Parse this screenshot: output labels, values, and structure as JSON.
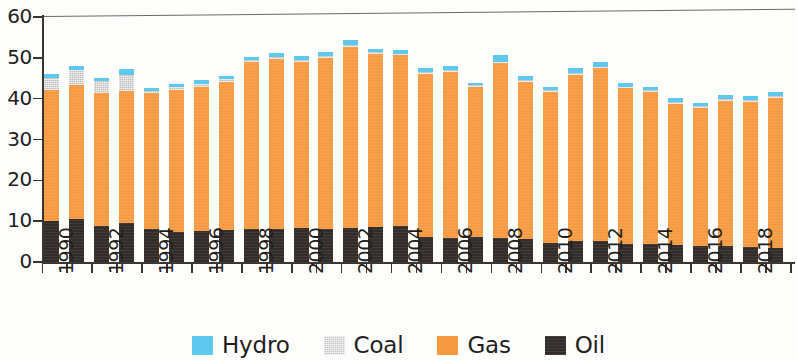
{
  "chart_data": {
    "type": "bar",
    "stacked": true,
    "title": "",
    "subtitle": "",
    "xlabel": "",
    "ylabel": "",
    "ylim": [
      0,
      60
    ],
    "ytick_labels": [
      "60",
      "50",
      "40",
      "30",
      "20",
      "10",
      "0"
    ],
    "ytick_values": [
      60,
      50,
      40,
      30,
      20,
      10,
      0
    ],
    "grid": false,
    "legend_position": "bottom",
    "categories": [
      "1990",
      "1991",
      "1992",
      "1993",
      "1994",
      "1995",
      "1996",
      "1997",
      "1998",
      "1999",
      "2000",
      "2001",
      "2002",
      "2003",
      "2004",
      "2005",
      "2006",
      "2007",
      "2008",
      "2009",
      "2010",
      "2011",
      "2012",
      "2013",
      "2014",
      "2015",
      "2016",
      "2017",
      "2018",
      "2019"
    ],
    "xtick_labels_shown": [
      "1990",
      "1992",
      "1994",
      "1996",
      "1998",
      "2000",
      "2002",
      "2004",
      "2006",
      "2008",
      "2010",
      "2012",
      "2014",
      "2016",
      "2018"
    ],
    "series": [
      {
        "name": "Oil",
        "color": "#332d2a",
        "values": [
          10.3,
          10.8,
          9.0,
          9.9,
          8.3,
          7.6,
          7.9,
          8.2,
          8.4,
          8.3,
          8.5,
          8.4,
          8.6,
          8.7,
          9.0,
          6.4,
          6.2,
          6.4,
          6.1,
          5.8,
          5.0,
          5.3,
          5.4,
          4.6,
          4.6,
          4.3,
          4.2,
          4.1,
          3.9,
          3.7
        ]
      },
      {
        "name": "Gas",
        "color": "#f79a41",
        "values": [
          32.0,
          32.8,
          32.7,
          32.2,
          33.3,
          34.8,
          35.1,
          36.1,
          40.8,
          41.6,
          40.8,
          41.9,
          44.3,
          42.4,
          41.9,
          40.0,
          40.7,
          36.6,
          42.8,
          38.6,
          36.9,
          40.8,
          42.3,
          38.2,
          37.3,
          34.7,
          33.8,
          35.7,
          35.5,
          36.8
        ]
      },
      {
        "name": "Coal",
        "color": "#c6c5c4",
        "values": [
          3.1,
          3.6,
          2.9,
          3.9,
          0.6,
          0.6,
          0.8,
          0.7,
          0.4,
          0.5,
          0.5,
          0.4,
          0.5,
          0.5,
          0.4,
          0.4,
          0.4,
          0.5,
          0.4,
          0.4,
          0.4,
          0.5,
          0.4,
          0.4,
          0.4,
          0.4,
          0.4,
          0.4,
          0.5,
          0.4
        ]
      },
      {
        "name": "Hydro",
        "color": "#5ec8ef",
        "values": [
          0.9,
          1.1,
          0.8,
          1.4,
          0.6,
          0.8,
          1.1,
          0.9,
          0.8,
          1.0,
          1.0,
          0.9,
          1.2,
          0.8,
          0.9,
          0.9,
          0.9,
          0.7,
          1.6,
          1.0,
          0.9,
          1.1,
          1.1,
          0.9,
          0.9,
          0.9,
          0.8,
          0.9,
          0.9,
          1.0
        ]
      }
    ],
    "totals": [
      46.3,
      48.3,
      45.4,
      47.4,
      42.8,
      43.8,
      44.9,
      45.9,
      50.4,
      51.4,
      50.8,
      51.6,
      54.6,
      52.4,
      52.2,
      47.7,
      48.2,
      44.2,
      50.9,
      45.8,
      43.2,
      47.7,
      49.2,
      44.1,
      43.2,
      40.3,
      39.2,
      41.1,
      40.8,
      41.9
    ]
  },
  "legend": {
    "items": [
      {
        "label": "Hydro",
        "icon": "hydro-swatch"
      },
      {
        "label": "Coal",
        "icon": "coal-swatch"
      },
      {
        "label": "Gas",
        "icon": "gas-swatch"
      },
      {
        "label": "Oil",
        "icon": "oil-swatch"
      }
    ]
  }
}
